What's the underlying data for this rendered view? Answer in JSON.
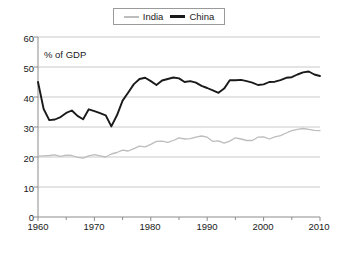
{
  "chart_data": {
    "type": "line",
    "title": "",
    "subtitle": "",
    "annotation": "% of GDP",
    "xlabel": "",
    "ylabel": "",
    "xlim": [
      1960,
      2010
    ],
    "ylim": [
      0,
      60
    ],
    "grid": true,
    "grid_axis": "y",
    "legend_position": "top-center",
    "x_ticks": [
      1960,
      1970,
      1980,
      1990,
      2000,
      2010
    ],
    "x_minor_ticks": [
      1965,
      1975,
      1985,
      1995,
      2005
    ],
    "y_ticks": [
      0,
      10,
      20,
      30,
      40,
      50,
      60
    ],
    "x": [
      1960,
      1961,
      1962,
      1963,
      1964,
      1965,
      1966,
      1967,
      1968,
      1969,
      1970,
      1971,
      1972,
      1973,
      1974,
      1975,
      1976,
      1977,
      1978,
      1979,
      1980,
      1981,
      1982,
      1983,
      1984,
      1985,
      1986,
      1987,
      1988,
      1989,
      1990,
      1991,
      1992,
      1993,
      1994,
      1995,
      1996,
      1997,
      1998,
      1999,
      2000,
      2001,
      2002,
      2003,
      2004,
      2005,
      2006,
      2007,
      2008,
      2009,
      2010
    ],
    "series": [
      {
        "name": "India",
        "color": "#bdbdbd",
        "values": [
          20.3,
          20.4,
          20.5,
          20.7,
          20.2,
          20.6,
          20.5,
          19.9,
          19.6,
          20.4,
          20.8,
          20.4,
          20.0,
          21.0,
          21.5,
          22.3,
          22.0,
          22.8,
          23.6,
          23.4,
          24.2,
          25.2,
          25.3,
          24.9,
          25.5,
          26.4,
          26.0,
          26.1,
          26.6,
          27.0,
          26.6,
          25.2,
          25.4,
          24.6,
          25.3,
          26.4,
          26.0,
          25.5,
          25.5,
          26.6,
          26.7,
          26.0,
          26.7,
          27.1,
          28.0,
          28.8,
          29.2,
          29.5,
          29.2,
          28.9,
          28.8
        ]
      },
      {
        "name": "China",
        "color": "#1a1a1a",
        "values": [
          45.0,
          36.0,
          32.3,
          32.5,
          33.3,
          34.7,
          35.5,
          33.7,
          32.6,
          35.9,
          35.3,
          34.6,
          33.9,
          30.2,
          33.9,
          38.8,
          41.5,
          44.3,
          46.0,
          46.4,
          45.3,
          44.0,
          45.5,
          46.0,
          46.5,
          46.2,
          45.0,
          45.3,
          44.8,
          43.7,
          43.0,
          42.2,
          41.4,
          42.8,
          45.6,
          45.6,
          45.7,
          45.3,
          44.8,
          44.0,
          44.2,
          45.0,
          45.1,
          45.6,
          46.4,
          46.6,
          47.5,
          48.2,
          48.5,
          47.5,
          47.0
        ]
      }
    ]
  },
  "legend": {
    "entries": [
      {
        "label": "India",
        "swatch": "line-swatch-light"
      },
      {
        "label": "China",
        "swatch": "line-swatch-dark"
      }
    ]
  },
  "axes": {
    "y_labels": [
      "60",
      "50",
      "40",
      "30",
      "20",
      "10",
      "0"
    ],
    "x_labels": [
      "1960",
      "1970",
      "1980",
      "1990",
      "2000",
      "2010"
    ],
    "note": "% of GDP"
  },
  "colors": {
    "india": "#bdbdbd",
    "china": "#1a1a1a",
    "grid": "#c9c9c9",
    "axis": "#8c8c8c",
    "background": "#ffffff"
  }
}
